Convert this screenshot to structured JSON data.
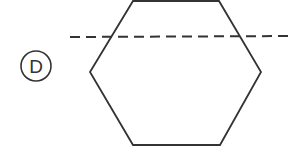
{
  "diagram": {
    "option_label": "D",
    "shape": "hexagon",
    "line_style": "dashed",
    "colors": {
      "stroke": "#333333",
      "background": "#ffffff"
    }
  }
}
